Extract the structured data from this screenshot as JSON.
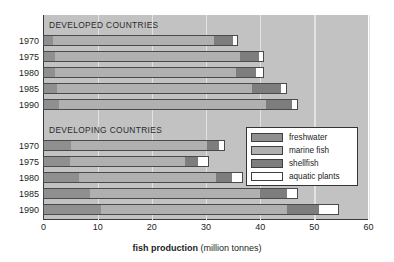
{
  "chart_data": {
    "type": "bar",
    "orientation": "horizontal",
    "stacked": true,
    "title": "",
    "xlabel_bold": "fish production",
    "xlabel_unit": "(million tonnes)",
    "ylabel": "",
    "xlim": [
      0,
      60
    ],
    "xticks": [
      0,
      10,
      20,
      30,
      40,
      50,
      60
    ],
    "xtick_labels": [
      "0",
      "10",
      "20",
      "30",
      "40",
      "50",
      "60"
    ],
    "grid": true,
    "grid_axis": "x",
    "legend_position": "inside-right-middle",
    "series": [
      {
        "name": "freshwater",
        "color": "#8f8f8f"
      },
      {
        "name": "marine fish",
        "color": "#b0b0b0"
      },
      {
        "name": "shellfish",
        "color": "#7d7d7d"
      },
      {
        "name": "aquatic plants",
        "color": "#ffffff"
      }
    ],
    "groups": [
      {
        "name": "DEVELOPED COUNTRIES",
        "categories": [
          "1970",
          "1975",
          "1980",
          "1985",
          "1990"
        ],
        "values": {
          "freshwater": [
            1.8,
            2.1,
            2.2,
            2.5,
            2.9
          ],
          "marine fish": [
            29.6,
            34.1,
            33.4,
            36.0,
            38.1
          ],
          "shellfish": [
            3.5,
            3.5,
            3.7,
            5.3,
            4.9
          ],
          "aquatic plants": [
            0.8,
            0.9,
            1.2,
            0.9,
            0.9
          ]
        },
        "totals": [
          35.7,
          40.6,
          40.5,
          44.7,
          46.8
        ]
      },
      {
        "name": "DEVELOPING COUNTRIES",
        "categories": [
          "1970",
          "1975",
          "1980",
          "1985",
          "1990"
        ],
        "values": {
          "freshwater": [
            5.1,
            4.8,
            6.6,
            8.5,
            10.6
          ],
          "marine fish": [
            25.1,
            21.4,
            25.2,
            31.5,
            34.4
          ],
          "shellfish": [
            2.2,
            2.4,
            3.0,
            4.9,
            5.8
          ],
          "aquatic plants": [
            0.9,
            1.8,
            1.9,
            1.9,
            3.5
          ]
        },
        "totals": [
          33.3,
          30.4,
          36.7,
          46.8,
          54.3
        ]
      }
    ]
  },
  "axis": {
    "x_title_bold": "fish production",
    "x_title_unit": "(million tonnes)",
    "ticks": [
      "0",
      "10",
      "20",
      "30",
      "40",
      "50",
      "60"
    ]
  },
  "legend": {
    "items": [
      {
        "label": "freshwater",
        "color": "#8f8f8f"
      },
      {
        "label": "marine fish",
        "color": "#b0b0b0"
      },
      {
        "label": "shellfish",
        "color": "#7d7d7d"
      },
      {
        "label": "aquatic plants",
        "color": "#ffffff"
      }
    ]
  },
  "groups_captions": {
    "developed": "DEVELOPED COUNTRIES",
    "developing": "DEVELOPING COUNTRIES"
  },
  "year_labels": [
    "1970",
    "1975",
    "1980",
    "1985",
    "1990"
  ]
}
